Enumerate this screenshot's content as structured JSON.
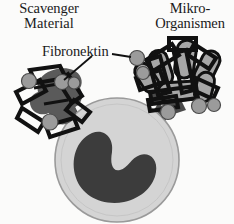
{
  "figure": {
    "title_left": {
      "line1": "Scavenger",
      "line2": "Material"
    },
    "title_right": {
      "line1": "Mikro-",
      "line2": "Organismen"
    },
    "callout": "Fibronektin"
  },
  "colors": {
    "background": "#fbfbfa",
    "outline": "#111111",
    "cell_cytoplasm": "#d4d4d4",
    "cell_outline": "#9a9a9a",
    "nucleus": "#3c3c3c",
    "pseudopod": "#4a4a4a",
    "scavenger_blob": "#5a5a5a",
    "microbe_body": "#a6a6a6",
    "fibronectin_dot": "#9b9b9b"
  },
  "elements": {
    "cell": {
      "cx": 117,
      "cy": 160,
      "r": 62,
      "label": "macrophage-cell"
    },
    "nucleus": {
      "label": "cell-nucleus"
    },
    "pseudopod_left": {
      "label": "pseudopod-left"
    },
    "pseudopod_right": {
      "label": "pseudopod-right"
    },
    "scavenger_cluster": {
      "label": "scavenger-material-cluster"
    },
    "microbe_cluster": {
      "label": "microorganism-cluster"
    },
    "fibronectin_dots": {
      "count": 9,
      "label": "fibronectin-binding-dot"
    },
    "leader_left": {
      "label": "fibronektin-leader-left"
    },
    "leader_right": {
      "label": "fibronektin-leader-right"
    }
  }
}
